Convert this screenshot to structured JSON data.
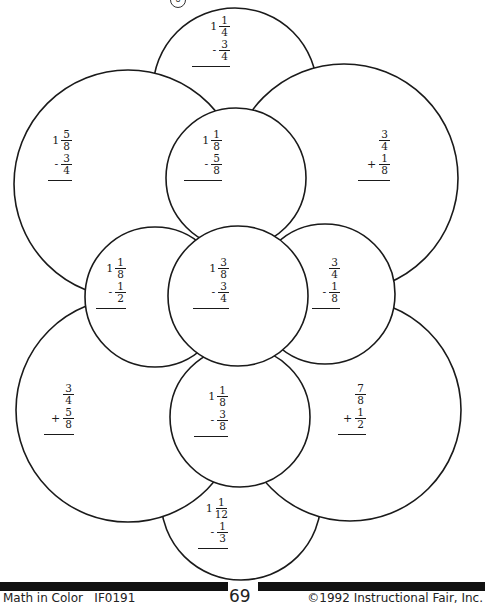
{
  "page": {
    "badge": "8",
    "page_number": "69",
    "footer_left": "Math in Color   IF0191",
    "footer_right": "©1992 Instructional Fair, Inc."
  },
  "problems": [
    {
      "id": "top",
      "whole": "1",
      "num1": "1",
      "den1": "4",
      "op": "-",
      "num2": "3",
      "den2": "4"
    },
    {
      "id": "upper-left",
      "whole": "1",
      "num1": "5",
      "den1": "8",
      "op": "-",
      "num2": "3",
      "den2": "4"
    },
    {
      "id": "upper-center",
      "whole": "1",
      "num1": "1",
      "den1": "8",
      "op": "-",
      "num2": "5",
      "den2": "8"
    },
    {
      "id": "upper-right",
      "whole": "",
      "num1": "3",
      "den1": "4",
      "op": "+",
      "num2": "1",
      "den2": "8"
    },
    {
      "id": "mid-left",
      "whole": "1",
      "num1": "1",
      "den1": "8",
      "op": "-",
      "num2": "1",
      "den2": "2"
    },
    {
      "id": "mid-center",
      "whole": "1",
      "num1": "3",
      "den1": "8",
      "op": "-",
      "num2": "3",
      "den2": "4"
    },
    {
      "id": "mid-right",
      "whole": "",
      "num1": "3",
      "den1": "4",
      "op": "-",
      "num2": "1",
      "den2": "8"
    },
    {
      "id": "lower-left",
      "whole": "",
      "num1": "3",
      "den1": "4",
      "op": "+",
      "num2": "5",
      "den2": "8"
    },
    {
      "id": "lower-center",
      "whole": "1",
      "num1": "1",
      "den1": "8",
      "op": "-",
      "num2": "3",
      "den2": "8"
    },
    {
      "id": "lower-right",
      "whole": "",
      "num1": "7",
      "den1": "8",
      "op": "+",
      "num2": "1",
      "den2": "2"
    },
    {
      "id": "bottom",
      "whole": "1",
      "num1": "1",
      "den1": "12",
      "op": "-",
      "num2": "1",
      "den2": "3"
    }
  ]
}
